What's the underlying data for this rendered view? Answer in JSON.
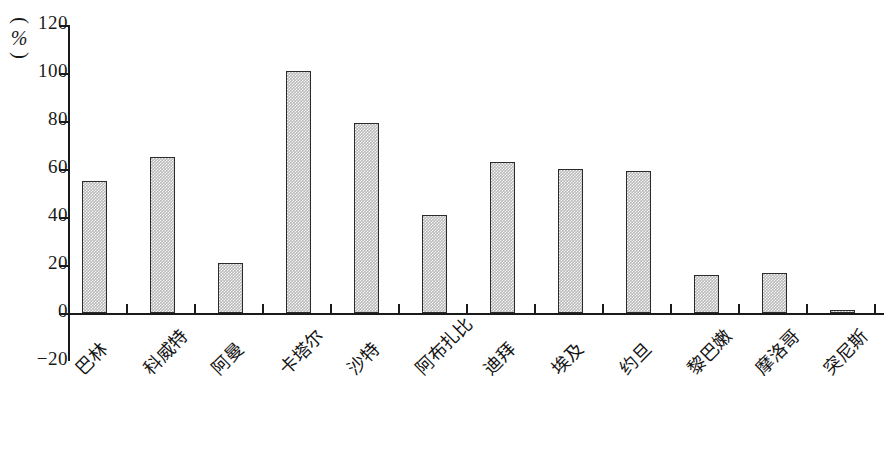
{
  "chart_data": {
    "type": "bar",
    "title": "",
    "subtitle": "",
    "xlabel": "",
    "ylabel": "(%)",
    "ylabel_parts": {
      "paren_top": "(",
      "unit": "%",
      "paren_bottom": ")"
    },
    "ylim": [
      -20,
      120
    ],
    "yticks": [
      -20,
      0,
      20,
      40,
      60,
      80,
      100,
      120
    ],
    "ytick_labels": [
      "-20",
      "0",
      "20",
      "40",
      "60",
      "80",
      "100",
      "120"
    ],
    "grid": false,
    "legend": null,
    "categories": [
      "巴林",
      "科威特",
      "阿曼",
      "卡塔尔",
      "沙特",
      "阿布扎比",
      "迪拜",
      "埃及",
      "约旦",
      "黎巴嫩",
      "摩洛哥",
      "突尼斯"
    ],
    "values": [
      55,
      65,
      21,
      101,
      79,
      41,
      63,
      60,
      59,
      16,
      16.5,
      1
    ],
    "series": [
      {
        "name": "",
        "values": [
          55,
          65,
          21,
          101,
          79,
          41,
          63,
          60,
          59,
          16,
          16.5,
          1
        ]
      }
    ],
    "bar_fill_color": "#b9b9b9",
    "bar_border_color": "#2b2b2b",
    "axis_color": "#1a1a1a"
  }
}
